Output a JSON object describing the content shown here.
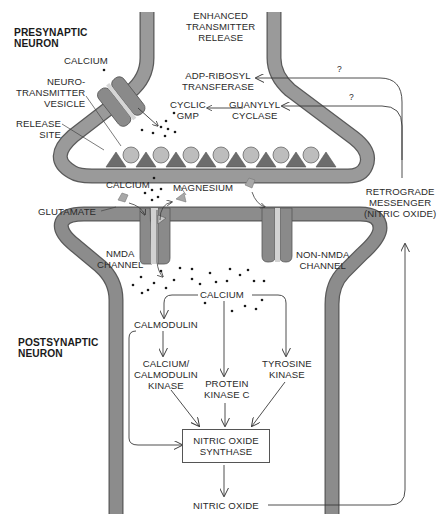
{
  "colors": {
    "membrane": "#8c8c8c",
    "membrane_edge": "#5a5a5a",
    "vesicle": "#b9b9b9",
    "release_site": "#6d6d6d",
    "channel": "#8a8a8a",
    "channel_pore": "#d2d2d2",
    "ligand": "#a8a8a8",
    "arrow": "#3a3a3a",
    "text": "#2a2a2a"
  },
  "regions": {
    "presynaptic": "PRESYNAPTIC\nNEURON",
    "postsynaptic": "POSTSYNAPTIC\nNEURON"
  },
  "presynaptic_labels": {
    "enhanced_release": "ENHANCED\nTRANSMITTER\nRELEASE",
    "calcium": "CALCIUM",
    "vesicle": "NEURO-\nTRANSMITTER\nVESICLE",
    "release_site": "RELEASE\nSITE",
    "adp_ribosyl": "ADP-RIBOSYL\nTRANSFERASE",
    "cyclic_gmp": "CYCLIC\nGMP",
    "guanylyl_cyclase": "GUANYLYL\nCYCLASE",
    "question_1": "?",
    "question_2": "?"
  },
  "cleft_labels": {
    "calcium": "CALCIUM",
    "magnesium": "MAGNESIUM",
    "glutamate": "GLUTAMATE",
    "retrograde": "RETROGRADE\nMESSENGER\n(NITRIC OXIDE)"
  },
  "postsynaptic_labels": {
    "nmda_channel": "NMDA\nCHANNEL",
    "non_nmda_channel": "NON-NMDA\nCHANNEL",
    "calcium": "CALCIUM",
    "calmodulin": "CALMODULIN",
    "cam_kinase": "CALCIUM/\nCALMODULIN\nKINASE",
    "pkc": "PROTEIN\nKINASE C",
    "tyrosine_kinase": "TYROSINE\nKINASE",
    "nos": "NITRIC OXIDE\nSYNTHASE",
    "nitric_oxide": "NITRIC OXIDE"
  }
}
